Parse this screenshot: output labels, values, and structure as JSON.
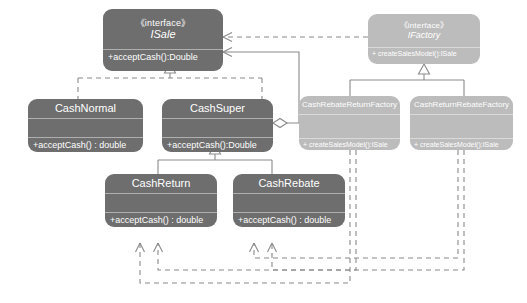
{
  "diagram": {
    "colors": {
      "dark_box": "#6e6e6e",
      "light_box": "#bcbcbc",
      "line": "#8a8a8a",
      "text": "#ffffff",
      "background": "#ffffff"
    },
    "stereotype_interface": "《interface》",
    "classes": [
      {
        "id": "isale",
        "name": "ISale",
        "stereotype": "《interface》",
        "is_interface": true,
        "style": "dark",
        "attributes": [],
        "operations": [
          "+acceptCash():Double"
        ]
      },
      {
        "id": "ifactory",
        "name": "IFactory",
        "stereotype": "《interface》",
        "is_interface": true,
        "style": "light",
        "attributes": [],
        "operations": [
          "+ createSalesModel():ISale"
        ]
      },
      {
        "id": "cashnormal",
        "name": "CashNormal",
        "stereotype": "",
        "is_interface": false,
        "style": "dark",
        "attributes": [],
        "operations": [
          "+acceptCash() : double"
        ]
      },
      {
        "id": "cashsuper",
        "name": "CashSuper",
        "stereotype": "",
        "is_interface": false,
        "style": "dark",
        "attributes": [],
        "operations": [
          "+acceptCash():Double"
        ]
      },
      {
        "id": "cashreturn",
        "name": "CashReturn",
        "stereotype": "",
        "is_interface": false,
        "style": "dark",
        "attributes": [],
        "operations": [
          "+acceptCash() : double"
        ]
      },
      {
        "id": "cashrebate",
        "name": "CashRebate",
        "stereotype": "",
        "is_interface": false,
        "style": "dark",
        "attributes": [],
        "operations": [
          "+acceptCash() : double"
        ]
      },
      {
        "id": "cashrebatereturnfactory",
        "name": "CashRebateReturnFactory",
        "stereotype": "",
        "is_interface": false,
        "style": "light",
        "attributes": [],
        "operations": [
          "+ createSalesModel():ISale"
        ]
      },
      {
        "id": "cashreturnrebatefactory",
        "name": "CashReturnRebateFactory",
        "stereotype": "",
        "is_interface": false,
        "style": "light",
        "attributes": [],
        "operations": [
          "+ createSalesModel():ISale"
        ]
      }
    ],
    "relationships": [
      {
        "type": "realization",
        "from": "CashNormal",
        "to": "ISale",
        "line": "dashed",
        "head": "hollow-triangle"
      },
      {
        "type": "realization",
        "from": "CashSuper",
        "to": "ISale",
        "line": "dashed",
        "head": "hollow-triangle"
      },
      {
        "type": "generalization",
        "from": "CashReturn",
        "to": "CashSuper",
        "line": "solid",
        "head": "hollow-triangle"
      },
      {
        "type": "generalization",
        "from": "CashRebate",
        "to": "CashSuper",
        "line": "solid",
        "head": "hollow-triangle"
      },
      {
        "type": "realization",
        "from": "CashRebateReturnFactory",
        "to": "IFactory",
        "line": "solid",
        "head": "hollow-triangle"
      },
      {
        "type": "realization",
        "from": "CashReturnRebateFactory",
        "to": "IFactory",
        "line": "solid",
        "head": "hollow-triangle"
      },
      {
        "type": "aggregation",
        "from": "CashSuper",
        "to": "ISale",
        "line": "solid",
        "head": "open-arrow",
        "tail": "hollow-diamond"
      },
      {
        "type": "dependency",
        "from": "IFactory",
        "to": "ISale",
        "line": "dashed",
        "head": "open-arrow"
      },
      {
        "type": "dependency",
        "from": "CashRebateReturnFactory",
        "to": "CashReturn",
        "line": "dashed",
        "head": "open-arrow"
      },
      {
        "type": "dependency",
        "from": "CashRebateReturnFactory",
        "to": "CashRebate",
        "line": "dashed",
        "head": "open-arrow"
      },
      {
        "type": "dependency",
        "from": "CashReturnRebateFactory",
        "to": "CashReturn",
        "line": "dashed",
        "head": "open-arrow"
      },
      {
        "type": "dependency",
        "from": "CashReturnRebateFactory",
        "to": "CashRebate",
        "line": "dashed",
        "head": "open-arrow"
      }
    ]
  }
}
